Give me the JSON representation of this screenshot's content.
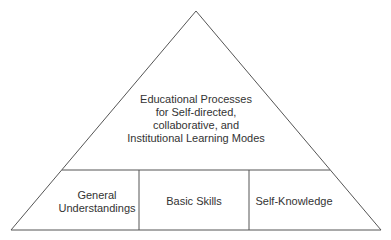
{
  "diagram": {
    "type": "pyramid",
    "line_color": "#555555",
    "text_color": "#333333",
    "apex_section": {
      "lines": [
        "Educational Processes",
        "for Self-directed,",
        "collaborative, and",
        "Institutional Learning Modes"
      ]
    },
    "base_sections": [
      {
        "lines": [
          "General",
          "Understandings"
        ]
      },
      {
        "lines": [
          "Basic Skills"
        ]
      },
      {
        "lines": [
          "Self-Knowledge"
        ]
      }
    ]
  }
}
